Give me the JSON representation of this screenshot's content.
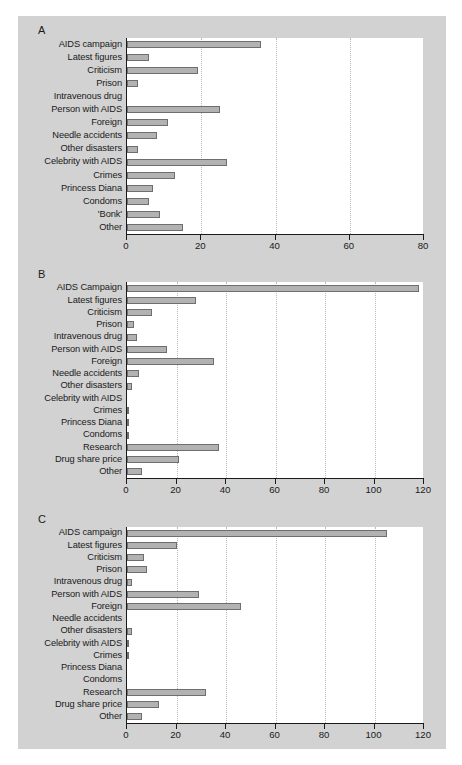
{
  "figure": {
    "background_color": "#d2d2d2",
    "plot_background_color": "#ffffff",
    "bar_fill_color": "#b2b2b2",
    "bar_edge_color": "#6e6e6e",
    "axis_color": "#1a1a1a",
    "gridline_color": "#b9b9b9"
  },
  "panels": [
    {
      "letter": "A"
    },
    {
      "letter": "B"
    },
    {
      "letter": "C"
    }
  ],
  "chart_data": [
    {
      "type": "bar",
      "orientation": "horizontal",
      "panel": "A",
      "title": "A",
      "xlabel": "",
      "ylabel": "",
      "xlim": [
        0,
        80
      ],
      "xticks": [
        0,
        20,
        40,
        60,
        80
      ],
      "grid": true,
      "legend": "none",
      "categories": [
        "AIDS campaign",
        "Latest figures",
        "Criticism",
        "Prison",
        "Intravenous drug",
        "Person with AIDS",
        "Foreign",
        "Needle accidents",
        "Other disasters",
        "Celebrity with AIDS",
        "Crimes",
        "Princess Diana",
        "Condoms",
        "'Bonk'",
        "Other"
      ],
      "values": [
        36,
        6,
        19,
        3,
        0,
        25,
        11,
        8,
        3,
        27,
        13,
        7,
        6,
        9,
        15
      ]
    },
    {
      "type": "bar",
      "orientation": "horizontal",
      "panel": "B",
      "title": "B",
      "xlabel": "",
      "ylabel": "",
      "xlim": [
        0,
        120
      ],
      "xticks": [
        0,
        20,
        40,
        60,
        80,
        100,
        120
      ],
      "grid": true,
      "legend": "none",
      "categories": [
        "AIDS Campaign",
        "Latest figures",
        "Criticism",
        "Prison",
        "Intravenous drug",
        "Person with AIDS",
        "Foreign",
        "Needle accidents",
        "Other disasters",
        "Celebrity with AIDS",
        "Crimes",
        "Princess Diana",
        "Condoms",
        "Research",
        "Drug share price",
        "Other"
      ],
      "values": [
        118,
        28,
        10,
        3,
        4,
        16,
        35,
        5,
        2,
        0,
        1,
        1,
        1,
        37,
        21,
        6
      ]
    },
    {
      "type": "bar",
      "orientation": "horizontal",
      "panel": "C",
      "title": "C",
      "xlabel": "",
      "ylabel": "",
      "xlim": [
        0,
        120
      ],
      "xticks": [
        0,
        20,
        40,
        60,
        80,
        100,
        120
      ],
      "grid": true,
      "legend": "none",
      "categories": [
        "AIDS campaign",
        "Latest figures",
        "Criticism",
        "Prison",
        "Intravenous drug",
        "Person with AIDS",
        "Foreign",
        "Needle accidents",
        "Other disasters",
        "Celebrity with AIDS",
        "Crimes",
        "Princess Diana",
        "Condoms",
        "Research",
        "Drug share price",
        "Other"
      ],
      "values": [
        105,
        20,
        7,
        8,
        2,
        29,
        46,
        0,
        2,
        1,
        1,
        0,
        0,
        32,
        13,
        6
      ]
    }
  ]
}
